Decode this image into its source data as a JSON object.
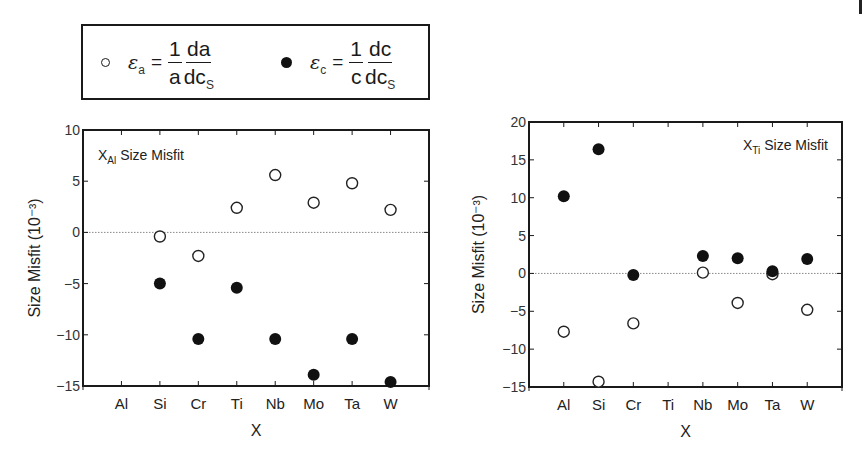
{
  "legend": {
    "entries": [
      {
        "marker": "open-circle",
        "symbol": "ε",
        "subscript": "a",
        "equals": "=",
        "frac1_num": "1",
        "frac1_den": "a",
        "frac2_num": "da",
        "frac2_den": "dc",
        "frac2_den_sub": "S"
      },
      {
        "marker": "filled-circle",
        "symbol": "ε",
        "subscript": "c",
        "equals": "=",
        "frac1_num": "1",
        "frac1_den": "c",
        "frac2_num": "dc",
        "frac2_den": "dc",
        "frac2_den_sub": "S"
      }
    ]
  },
  "chart_data": [
    {
      "type": "scatter",
      "title": "X_Al Size Misfit",
      "title_main": "X",
      "title_sub": "Al",
      "title_rest": " Size Misfit",
      "title_position": "top-left",
      "xlabel": "X",
      "ylabel": "Size Misfit (10⁻³)",
      "categories": [
        "Al",
        "Si",
        "Cr",
        "Ti",
        "Nb",
        "Mo",
        "Ta",
        "W"
      ],
      "ylim": [
        -15,
        10
      ],
      "yticks": [
        10,
        5,
        0,
        -5,
        -10,
        -15
      ],
      "ytick_labels": [
        "10",
        "5",
        "0",
        "−5",
        "−10",
        "−15"
      ],
      "zero_line": "dotted",
      "grid": false,
      "series": [
        {
          "name": "ε_a = (1/a)(da/dc_S)",
          "marker": "open-circle",
          "values": [
            null,
            -0.4,
            -2.3,
            2.4,
            5.6,
            2.9,
            4.8,
            2.2
          ]
        },
        {
          "name": "ε_c = (1/c)(dc/dc_S)",
          "marker": "filled-circle",
          "values": [
            null,
            -5.0,
            -10.4,
            -5.4,
            -10.4,
            -13.9,
            -10.4,
            -14.6
          ]
        }
      ]
    },
    {
      "type": "scatter",
      "title": "X_Ti Size Misfit",
      "title_main": "X",
      "title_sub": "Ti",
      "title_rest": " Size Misfit",
      "title_position": "top-right",
      "xlabel": "X",
      "ylabel": "Size Misfit (10⁻³)",
      "categories": [
        "Al",
        "Si",
        "Cr",
        "Ti",
        "Nb",
        "Mo",
        "Ta",
        "W"
      ],
      "ylim": [
        -15,
        20
      ],
      "yticks": [
        20,
        15,
        10,
        5,
        0,
        -5,
        -10,
        -15
      ],
      "ytick_labels": [
        "20",
        "15",
        "10",
        "5",
        "0",
        "−5",
        "−10",
        "−15"
      ],
      "zero_line": "dotted",
      "grid": false,
      "series": [
        {
          "name": "ε_a = (1/a)(da/dc_S)",
          "marker": "open-circle",
          "values": [
            -7.7,
            -14.3,
            -6.6,
            null,
            0.1,
            -3.9,
            -0.1,
            -4.8
          ]
        },
        {
          "name": "ε_c = (1/c)(dc/dc_S)",
          "marker": "filled-circle",
          "values": [
            10.2,
            16.4,
            -0.2,
            null,
            2.3,
            2.0,
            0.3,
            1.9
          ]
        }
      ]
    }
  ],
  "colors": {
    "ink": "#1a1a1a",
    "zero_line": "#888888",
    "background": "#ffffff"
  }
}
